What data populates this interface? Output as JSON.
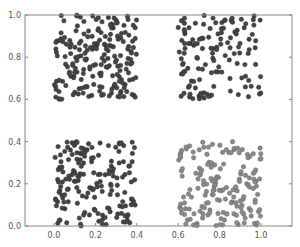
{
  "chart_data": {
    "type": "scatter",
    "title": "",
    "xlabel": "",
    "ylabel": "",
    "xlim": [
      -0.14,
      1.15
    ],
    "ylim": [
      0.0,
      1.0
    ],
    "grid": false,
    "legend": null,
    "x_ticks": [
      "0.0",
      "0.2",
      "0.4",
      "0.6",
      "0.8",
      "1.0"
    ],
    "x_tick_values": [
      0.0,
      0.2,
      0.4,
      0.6,
      0.8,
      1.0
    ],
    "y_ticks": [
      "0.0",
      "0.2",
      "0.4",
      "0.6",
      "0.8",
      "1.0"
    ],
    "y_tick_values": [
      0.0,
      0.2,
      0.4,
      0.6,
      0.8,
      1.0
    ],
    "series": [
      {
        "name": "cluster top-left",
        "color": "#444444",
        "edge": "#333333",
        "x_range": [
          0.0,
          0.4
        ],
        "y_range": [
          0.6,
          1.0
        ],
        "count": 200,
        "seed": 11
      },
      {
        "name": "cluster top-right",
        "color": "#444444",
        "edge": "#333333",
        "x_range": [
          0.6,
          1.0
        ],
        "y_range": [
          0.6,
          1.0
        ],
        "count": 130,
        "seed": 23
      },
      {
        "name": "cluster bottom-left",
        "color": "#444444",
        "edge": "#333333",
        "x_range": [
          0.0,
          0.4
        ],
        "y_range": [
          0.0,
          0.4
        ],
        "count": 170,
        "seed": 37
      },
      {
        "name": "cluster bottom-right",
        "color": "#8a8a8a",
        "edge": "#666666",
        "x_range": [
          0.6,
          1.0
        ],
        "y_range": [
          0.0,
          0.4
        ],
        "count": 170,
        "seed": 51
      }
    ]
  },
  "plot_area": {
    "left": 25,
    "top": 15,
    "right": 292,
    "bottom": 226
  }
}
